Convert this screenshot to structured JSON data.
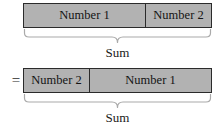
{
  "figure": {
    "equals_symbol": "=",
    "background_color": "#ffffff",
    "bar_fill_color": "#b2b2b2",
    "bar_border_color": "#2b2b2b",
    "brace_color": "#aaaaaa",
    "text_color": "#1a1a1a"
  },
  "rows": [
    {
      "id": "row-top",
      "prefix": "",
      "segments": [
        {
          "label": "Number 1",
          "width_px": 121
        },
        {
          "label": "Number 2",
          "width_px": 68
        }
      ],
      "brace_label": "Sum"
    },
    {
      "id": "row-bottom",
      "prefix": "=",
      "segments": [
        {
          "label": "Number 2",
          "width_px": 65
        },
        {
          "label": "Number 1",
          "width_px": 124
        }
      ],
      "brace_label": "Sum"
    }
  ]
}
